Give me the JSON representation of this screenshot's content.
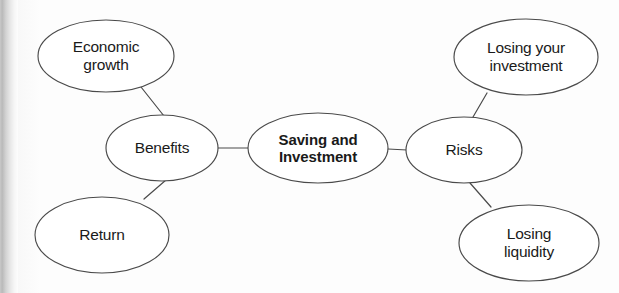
{
  "diagram": {
    "type": "mind-map",
    "title": "Saving and Investment",
    "canvas": {
      "width": 619,
      "height": 293
    },
    "stroke_color": "#4a4a4a",
    "text_color": "#1a1a1a",
    "background_color": "#fdfdfd",
    "nodes": [
      {
        "id": "economic-growth",
        "label": "Economic\ngrowth",
        "cx": 106,
        "cy": 56,
        "rx": 68,
        "ry": 36,
        "emphasis": "normal"
      },
      {
        "id": "benefits",
        "label": "Benefits",
        "cx": 162,
        "cy": 148,
        "rx": 56,
        "ry": 33,
        "emphasis": "normal"
      },
      {
        "id": "return",
        "label": "Return",
        "cx": 102,
        "cy": 235,
        "rx": 67,
        "ry": 38,
        "emphasis": "normal"
      },
      {
        "id": "saving-and-investment",
        "label": "Saving and\nInvestment",
        "cx": 318,
        "cy": 148,
        "rx": 70,
        "ry": 35,
        "emphasis": "bold"
      },
      {
        "id": "risks",
        "label": "Risks",
        "cx": 464,
        "cy": 150,
        "rx": 58,
        "ry": 33,
        "emphasis": "normal"
      },
      {
        "id": "losing-your-investment",
        "label": "Losing your\ninvestment",
        "cx": 526,
        "cy": 57,
        "rx": 72,
        "ry": 38,
        "emphasis": "normal"
      },
      {
        "id": "losing-liquidity",
        "label": "Losing\nliquidity",
        "cx": 529,
        "cy": 243,
        "rx": 70,
        "ry": 38,
        "emphasis": "normal"
      }
    ],
    "edges": [
      {
        "id": "edge-economic-growth-benefits",
        "from": "economic-growth",
        "to": "benefits",
        "x1": 141,
        "y1": 87,
        "x2": 164,
        "y2": 116
      },
      {
        "id": "edge-benefits-return",
        "from": "benefits",
        "to": "return",
        "x1": 166,
        "y1": 180,
        "x2": 144,
        "y2": 199
      },
      {
        "id": "edge-benefits-center",
        "from": "benefits",
        "to": "saving-and-investment",
        "x1": 218,
        "y1": 148,
        "x2": 249,
        "y2": 148
      },
      {
        "id": "edge-center-risks",
        "from": "saving-and-investment",
        "to": "risks",
        "x1": 388,
        "y1": 149,
        "x2": 407,
        "y2": 150
      },
      {
        "id": "edge-risks-losing-your-investment",
        "from": "risks",
        "to": "losing-your-investment",
        "x1": 473,
        "y1": 117,
        "x2": 487,
        "y2": 93
      },
      {
        "id": "edge-risks-losing-liquidity",
        "from": "risks",
        "to": "losing-liquidity",
        "x1": 470,
        "y1": 183,
        "x2": 491,
        "y2": 207
      }
    ]
  }
}
